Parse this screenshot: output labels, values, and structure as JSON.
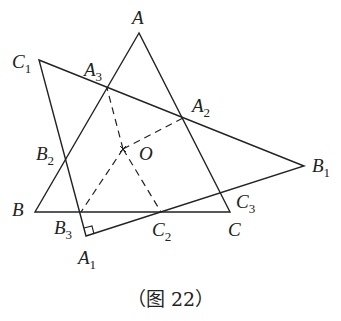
{
  "figure": {
    "caption": "（图 22）",
    "points": {
      "A": {
        "name": "A",
        "sub": "",
        "x": 139,
        "y": 33
      },
      "B": {
        "name": "B",
        "sub": "",
        "x": 35,
        "y": 212
      },
      "C": {
        "name": "C",
        "sub": "",
        "x": 230,
        "y": 212
      },
      "A1": {
        "name": "A",
        "sub": "1",
        "x": 86,
        "y": 236
      },
      "B1": {
        "name": "B",
        "sub": "1",
        "x": 304,
        "y": 166
      },
      "C1": {
        "name": "C",
        "sub": "1",
        "x": 39,
        "y": 60
      },
      "A2": {
        "name": "A",
        "sub": "2",
        "x": 183,
        "y": 118
      },
      "B2": {
        "name": "B",
        "sub": "2",
        "x": 65,
        "y": 159
      },
      "C2": {
        "name": "C",
        "sub": "2",
        "x": 161,
        "y": 212
      },
      "A3": {
        "name": "A",
        "sub": "3",
        "x": 107,
        "y": 88
      },
      "B3": {
        "name": "B",
        "sub": "3",
        "x": 81,
        "y": 212
      },
      "C3": {
        "name": "C",
        "sub": "3",
        "x": 222,
        "y": 193
      },
      "O": {
        "name": "O",
        "sub": "",
        "x": 123,
        "y": 149
      }
    },
    "solid_segments": [
      [
        "A",
        "B"
      ],
      [
        "B",
        "C"
      ],
      [
        "C",
        "A"
      ],
      [
        "A1",
        "B1"
      ],
      [
        "B1",
        "C1"
      ],
      [
        "C1",
        "A1"
      ]
    ],
    "dashed_segments": [
      [
        "O",
        "A2"
      ],
      [
        "O",
        "A3"
      ],
      [
        "O",
        "B3"
      ],
      [
        "O",
        "C2"
      ]
    ],
    "right_angle_at": "A1"
  }
}
